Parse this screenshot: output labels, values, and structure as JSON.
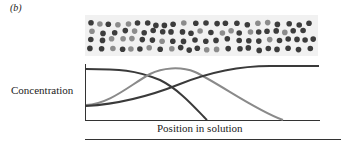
{
  "figure": {
    "panel_label": "(b)",
    "y_axis_label": "Concentration",
    "x_axis_label": "Position in solution"
  },
  "colors": {
    "panel_background": "#f1f1f1",
    "dark_particle": "#3c3c3c",
    "light_particle": "#8c8c8c",
    "dark_curve": "#3a3a3a",
    "light_curve": "#8a8a8a",
    "axis": "#333333"
  },
  "particles": {
    "rows": 4,
    "note": "light-gray particles concentrated toward left/center, dark particles throughout"
  },
  "curves": [
    {
      "name": "dark-descending",
      "description": "starts high at left, falls to zero mid-plot"
    },
    {
      "name": "gray-bell",
      "description": "rises from low, peaks left-of-center, falls to zero right of center"
    },
    {
      "name": "dark-ascending",
      "description": "starts low at left, rises and plateaus high at right"
    }
  ]
}
